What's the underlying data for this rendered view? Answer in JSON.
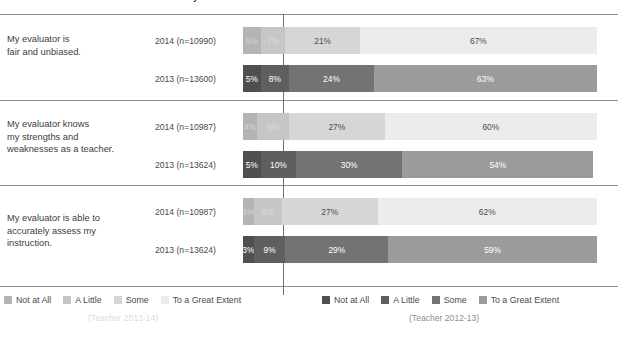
{
  "title": {
    "main": "2012-13 and 2013-14 TELL Teacher Survey",
    "clipped": true
  },
  "chart_data": {
    "type": "bar",
    "orientation": "horizontal",
    "stacked": true,
    "stack_total": 100,
    "unit": "%",
    "title": "2012-13 and 2013-14 TELL Teacher Survey",
    "xlabel": "",
    "ylabel": "",
    "xlim": [
      0,
      100
    ],
    "grid": false,
    "reference_line_at_percent": 12,
    "categories": [
      "Not at All",
      "A Little",
      "Some",
      "To a Great Extent"
    ],
    "groups": [
      {
        "question": "My evaluator is\nfair and unbiased.",
        "question_lines": [
          "My evaluator is",
          "fair and unbiased."
        ],
        "rows": [
          {
            "series": "2014",
            "n": 10990,
            "label": "2014 (n=10990)",
            "palette": "light",
            "values": [
              5,
              7,
              21,
              67
            ],
            "value_labels": [
              "5%",
              "7%",
              "21%",
              "67%"
            ]
          },
          {
            "series": "2013",
            "n": 13600,
            "label": "2013 (n=13600)",
            "palette": "dark",
            "values": [
              5,
              8,
              24,
              63
            ],
            "value_labels": [
              "5%",
              "8%",
              "24%",
              "63%"
            ]
          }
        ]
      },
      {
        "question": "My evaluator knows\nmy strengths and\nweaknesses as a teacher.",
        "question_lines": [
          "My evaluator knows",
          "my strengths and",
          "weaknesses as a teacher."
        ],
        "rows": [
          {
            "series": "2014",
            "n": 10987,
            "label": "2014 (n=10987)",
            "palette": "light",
            "values": [
              4,
              9,
              27,
              60
            ],
            "value_labels": [
              "4%",
              "9%",
              "27%",
              "60%"
            ]
          },
          {
            "series": "2013",
            "n": 13624,
            "label": "2013 (n=13624)",
            "palette": "dark",
            "values": [
              5,
              10,
              30,
              54
            ],
            "value_labels": [
              "5%",
              "10%",
              "30%",
              "54%"
            ]
          }
        ]
      },
      {
        "question": "My evaluator is able to\naccurately assess my\ninstruction.",
        "question_lines": [
          "My evaluator is able to",
          "accurately assess my",
          "instruction."
        ],
        "rows": [
          {
            "series": "2014",
            "n": 10987,
            "label": "2014 (n=10987)",
            "palette": "light",
            "values": [
              3,
              8,
              27,
              62
            ],
            "value_labels": [
              "3%",
              "8%",
              "27%",
              "62%"
            ]
          },
          {
            "series": "2013",
            "n": 13624,
            "label": "2013 (n=13624)",
            "palette": "dark",
            "values": [
              3,
              9,
              29,
              59
            ],
            "value_labels": [
              "3%",
              "9%",
              "29%",
              "59%"
            ]
          }
        ]
      }
    ]
  },
  "legends": [
    {
      "id": "legend-2013-14",
      "caption": "(Teacher 2013-14)",
      "items": [
        {
          "label": "Not at All",
          "color": "#b4b4b4"
        },
        {
          "label": "A Little",
          "color": "#c6c6c6"
        },
        {
          "label": "Some",
          "color": "#d6d6d6"
        },
        {
          "label": "To a Great Extent",
          "color": "#ececec"
        }
      ]
    },
    {
      "id": "legend-2012-13",
      "caption": "(Teacher 2012-13)",
      "items": [
        {
          "label": "Not at All",
          "color": "#4f4f4f"
        },
        {
          "label": "A Little",
          "color": "#5f5f5f"
        },
        {
          "label": "Some",
          "color": "#737373"
        },
        {
          "label": "To a Great Extent",
          "color": "#9b9b9b"
        }
      ]
    }
  ]
}
